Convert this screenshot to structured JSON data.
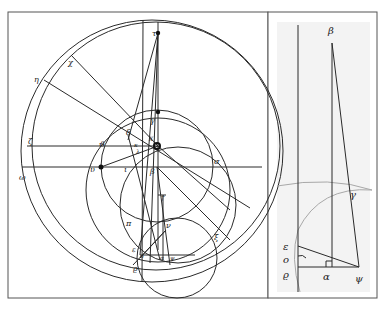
{
  "left_panel": {
    "labels": [
      {
        "id": "tau",
        "text": "τ",
        "x": 152,
        "y": 36
      },
      {
        "id": "gamma",
        "text": "γ",
        "x": 150,
        "y": 123
      },
      {
        "id": "eta",
        "text": "η",
        "x": 34,
        "y": 82
      },
      {
        "id": "chi",
        "text": "χ",
        "x": 68,
        "y": 65
      },
      {
        "id": "delta",
        "text": "δ",
        "x": 126,
        "y": 135
      },
      {
        "id": "theta",
        "text": "ϑ",
        "x": 99,
        "y": 147
      },
      {
        "id": "kappa",
        "text": "κ",
        "x": 134,
        "y": 147
      },
      {
        "id": "lambda",
        "text": "λ",
        "x": 136,
        "y": 153
      },
      {
        "id": "x",
        "text": "X",
        "x": 151,
        "y": 142
      },
      {
        "id": "zeta",
        "text": "ζ",
        "x": 28,
        "y": 144
      },
      {
        "id": "omega",
        "text": "ω",
        "x": 19,
        "y": 178
      },
      {
        "id": "upsilon",
        "text": "υ",
        "x": 90,
        "y": 172
      },
      {
        "id": "iota",
        "text": "ι",
        "x": 124,
        "y": 172
      },
      {
        "id": "beta",
        "text": "β",
        "x": 150,
        "y": 174
      },
      {
        "id": "sigma",
        "text": "σ",
        "x": 214,
        "y": 164
      },
      {
        "id": "pi",
        "text": "π",
        "x": 126,
        "y": 226
      },
      {
        "id": "nu",
        "text": "ν",
        "x": 166,
        "y": 228
      },
      {
        "id": "epsilon",
        "text": "ε",
        "x": 132,
        "y": 251
      },
      {
        "id": "o",
        "text": "ο",
        "x": 140,
        "y": 258
      },
      {
        "id": "alpha",
        "text": "α",
        "x": 164,
        "y": 260
      },
      {
        "id": "psi",
        "text": "ψ",
        "x": 170,
        "y": 260
      },
      {
        "id": "rho",
        "text": "ϱ",
        "x": 133,
        "y": 270
      },
      {
        "id": "xi",
        "text": "ξ",
        "x": 214,
        "y": 238
      },
      {
        "id": "dagger",
        "text": "†",
        "x": 161,
        "y": 200
      }
    ]
  },
  "right_panel": {
    "labels": [
      {
        "id": "beta",
        "text": "β",
        "x": 334,
        "y": 34
      },
      {
        "id": "gamma",
        "text": "γ",
        "x": 349,
        "y": 196
      },
      {
        "id": "epsilon",
        "text": "ε",
        "x": 287,
        "y": 251
      },
      {
        "id": "o",
        "text": "ο",
        "x": 287,
        "y": 263
      },
      {
        "id": "alpha",
        "text": "α",
        "x": 327,
        "y": 270
      },
      {
        "id": "psi",
        "text": "ψ",
        "x": 359,
        "y": 272
      },
      {
        "id": "rho",
        "text": "ϱ",
        "x": 287,
        "y": 278
      }
    ]
  },
  "colors": {
    "ink": "#2a2a2a",
    "frame": "#555555",
    "panel_bg": "#f3f3f3",
    "arc": "#a8a8a8"
  }
}
